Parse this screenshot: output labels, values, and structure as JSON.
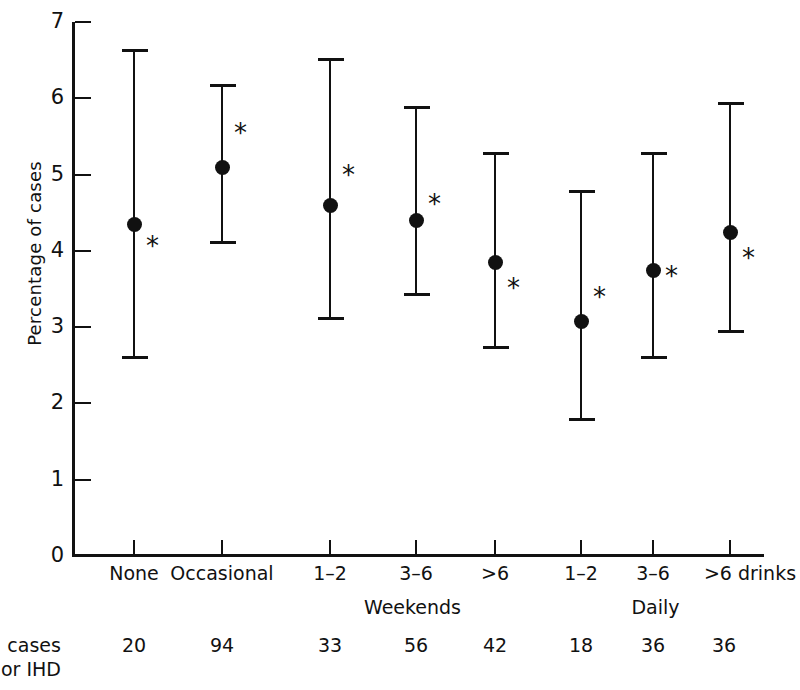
{
  "chart_data": {
    "type": "scatter",
    "title": "",
    "xlabel": "",
    "ylabel": "Percentage of cases",
    "ylim": [
      0,
      7
    ],
    "ytick_labels": [
      "0",
      "1",
      "2",
      "3",
      "4",
      "5",
      "6",
      "7"
    ],
    "ytick_values": [
      0,
      1,
      2,
      3,
      4,
      5,
      6,
      7
    ],
    "grid": false,
    "legend": null,
    "categories": [
      "None",
      "Occasional",
      "1–2",
      "3–6",
      ">6",
      "1–2",
      "3–6",
      ">6 drinks"
    ],
    "group_labels": [
      "Weekends",
      "Daily"
    ],
    "values": [
      4.35,
      5.1,
      4.6,
      4.4,
      3.85,
      3.08,
      3.75,
      4.25
    ],
    "ci_lower": [
      2.6,
      4.1,
      3.1,
      3.42,
      2.73,
      1.78,
      2.6,
      2.93
    ],
    "ci_upper": [
      6.65,
      6.18,
      6.53,
      5.9,
      5.3,
      4.8,
      5.3,
      5.95
    ],
    "annotations": [
      "*",
      "*",
      "*",
      "*",
      "*",
      "*",
      "*",
      "*"
    ],
    "annotation_symbol": "*",
    "table": {
      "row_label_line1": "o. cases",
      "row_label_line2": "ajor IHD",
      "values": [
        "20",
        "94",
        "33",
        "56",
        "42",
        "18",
        "36",
        "36"
      ]
    }
  },
  "axis": {
    "y_title": "Percentage of cases"
  }
}
